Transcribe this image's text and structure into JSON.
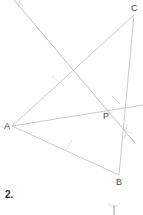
{
  "diagram": {
    "type": "geometric-construction",
    "points": [
      {
        "name": "A",
        "x": 12,
        "y": 126
      },
      {
        "name": "B",
        "x": 119,
        "y": 175
      },
      {
        "name": "C",
        "x": 134,
        "y": 15
      },
      {
        "name": "P",
        "x": 107,
        "y": 111
      }
    ],
    "labels": {
      "A": "A",
      "B": "B",
      "C": "C",
      "P": "P"
    },
    "segments": [
      {
        "from": "A",
        "to": "C"
      },
      {
        "from": "A",
        "to": "B"
      },
      {
        "from": "B",
        "to": "C"
      }
    ],
    "construction_lines": [
      {
        "name": "perpendicular-bisector-of-AC",
        "from": [
          14,
          0
        ],
        "to": [
          135,
          143
        ]
      },
      {
        "name": "angle-bisector-from-A",
        "from": [
          12,
          126
        ],
        "to": [
          143,
          105
        ]
      }
    ],
    "colors": {
      "line": "#b8b8b8",
      "label": "#444444",
      "arc": "#d0d0d0"
    }
  },
  "problem_number": "2."
}
